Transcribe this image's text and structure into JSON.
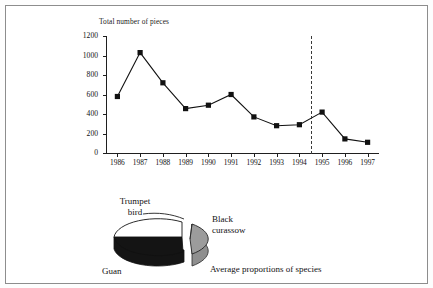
{
  "figure": {
    "chart_title": "Total number of pieces",
    "pie_caption": "Average proportions of species"
  },
  "chart_data": {
    "type": "line",
    "title": "Total number of pieces",
    "xlabel": "",
    "ylabel": "Total number of pieces",
    "ylim": [
      0,
      1200
    ],
    "ytick_labels": [
      "0",
      "200",
      "400",
      "600",
      "800",
      "1000",
      "1200"
    ],
    "ytick_values": [
      0,
      200,
      400,
      600,
      800,
      1000,
      1200
    ],
    "grid": false,
    "legend": "none",
    "marker": "filled-square",
    "categories": [
      "1986",
      "1987",
      "1988",
      "1989",
      "1990",
      "1991",
      "1992",
      "1993",
      "1994",
      "1995",
      "1996",
      "1997"
    ],
    "values": [
      580,
      1030,
      720,
      455,
      490,
      600,
      370,
      280,
      290,
      420,
      145,
      110
    ],
    "annotations": [
      {
        "type": "vertical-dashed-line",
        "at": "1994.5",
        "label": ""
      }
    ]
  },
  "pie_data": {
    "type": "pie",
    "title": "Average proportions of species",
    "style": "3d-exploded",
    "labels": [
      "Trumpet bird",
      "Black curassow",
      "Guan"
    ],
    "slices": [
      {
        "label_line1": "Trumpet",
        "label_line2": "bird",
        "color": "#ffffff",
        "share": 30
      },
      {
        "label_line1": "Black",
        "label_line2": "curassow",
        "color": "#9a9a9a",
        "share": 28,
        "exploded": true
      },
      {
        "label_line1": "Guan",
        "label_line2": "",
        "color": "#121212",
        "share": 42
      }
    ]
  }
}
